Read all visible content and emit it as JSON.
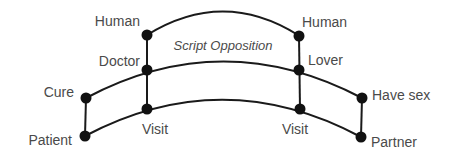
{
  "diagram": {
    "title": "Script Opposition",
    "nodes": {
      "human_left": "Human",
      "human_right": "Human",
      "doctor": "Doctor",
      "lover": "Lover",
      "cure": "Cure",
      "have_sex": "Have sex",
      "visit_left": "Visit",
      "visit_right": "Visit",
      "patient": "Patient",
      "partner": "Partner"
    },
    "colors": {
      "line": "#1a1a1a",
      "node": "#111111",
      "text": "#4a4a4a"
    }
  }
}
